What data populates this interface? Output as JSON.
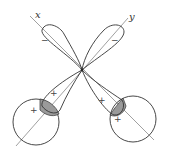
{
  "diagram": {
    "axes": [
      {
        "label": "x"
      },
      {
        "label": "y"
      }
    ],
    "lobes": [
      {
        "name": "x-negative-lobe",
        "sign": "−"
      },
      {
        "name": "y-negative-lobe",
        "sign": "−"
      },
      {
        "name": "y-positive-lobe",
        "sign": "+"
      },
      {
        "name": "x-positive-lobe",
        "sign": "+"
      }
    ],
    "s_orbitals": [
      {
        "name": "left-s-orbital",
        "sign": "+"
      },
      {
        "name": "right-s-orbital",
        "sign": "+"
      }
    ],
    "colors": {
      "line": "#333333",
      "axis": "#777777",
      "overlap": "#9a9a9a"
    }
  }
}
